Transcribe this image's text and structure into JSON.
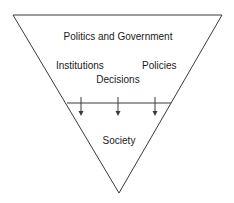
{
  "diagram": {
    "type": "inverted-triangle",
    "top_section": {
      "title": "Politics and Government",
      "items": [
        "Institutions",
        "Decisions",
        "Policies"
      ]
    },
    "bottom_section": {
      "label": "Society"
    },
    "arrows": {
      "count": 3,
      "direction": "down",
      "meaning": "from Politics and Government to Society"
    },
    "colors": {
      "line": "#3a3a3a",
      "text": "#1a1a1a",
      "background": "#ffffff"
    }
  }
}
